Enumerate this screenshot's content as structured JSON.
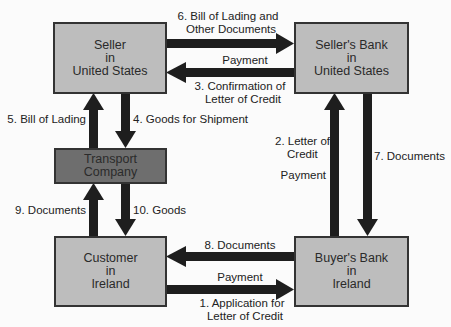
{
  "nodes": {
    "seller": {
      "lines": [
        "Seller",
        "in",
        "United States"
      ]
    },
    "sellers_bank": {
      "lines": [
        "Seller's Bank",
        "in",
        "United States"
      ]
    },
    "transport": {
      "lines": [
        "Transport Company"
      ]
    },
    "customer": {
      "lines": [
        "Customer",
        "in",
        "Ireland"
      ]
    },
    "buyers_bank": {
      "lines": [
        "Buyer's Bank",
        "in",
        "Ireland"
      ]
    }
  },
  "edges": {
    "e6": {
      "lines": [
        "6. Bill of Lading and",
        "Other Documents"
      ]
    },
    "e3_payment": {
      "label": "Payment"
    },
    "e3": {
      "lines": [
        "3. Confirmation of",
        "Letter of Credit"
      ]
    },
    "e5": {
      "label": "5. Bill of Lading"
    },
    "e4": {
      "label": "4. Goods for Shipment"
    },
    "e2": {
      "lines": [
        "2. Letter of",
        "Credit"
      ]
    },
    "e2_payment": {
      "label": "Payment"
    },
    "e7": {
      "label": "7. Documents"
    },
    "e9": {
      "label": "9. Documents"
    },
    "e10": {
      "label": "10. Goods"
    },
    "e8": {
      "label": "8. Documents"
    },
    "e1_payment": {
      "label": "Payment"
    },
    "e1": {
      "lines": [
        "1. Application for",
        "Letter of Credit"
      ]
    }
  },
  "colors": {
    "box_fill": "#bdbdbd",
    "transport_fill": "#6e6e6e",
    "arrow": "#1e1e1e"
  }
}
